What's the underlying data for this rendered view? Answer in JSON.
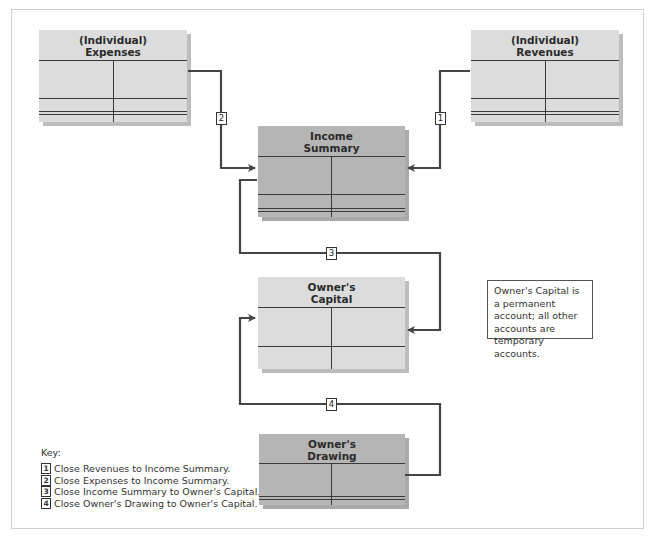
{
  "diagram": {
    "accounts": {
      "expenses": {
        "title_line1": "(Individual)",
        "title_line2": "Expenses"
      },
      "revenues": {
        "title_line1": "(Individual)",
        "title_line2": "Revenues"
      },
      "income_summary": {
        "title_line1": "Income",
        "title_line2": "Summary"
      },
      "owners_capital": {
        "title_line1": "Owner's",
        "title_line2": "Capital"
      },
      "owners_drawing": {
        "title_line1": "Owner's",
        "title_line2": "Drawing"
      }
    },
    "connectors": [
      {
        "label": "1",
        "from": "Revenues",
        "to": "Income Summary"
      },
      {
        "label": "2",
        "from": "Expenses",
        "to": "Income Summary"
      },
      {
        "label": "3",
        "from": "Income Summary",
        "to": "Owner's Capital"
      },
      {
        "label": "4",
        "from": "Owner's Drawing",
        "to": "Owner's Capital"
      }
    ],
    "note": "Owner's Capital is a permanent account; all other accounts are temporary accounts.",
    "key": {
      "title": "Key:",
      "items": [
        {
          "num": "1",
          "text": "Close Revenues to Income Summary."
        },
        {
          "num": "2",
          "text": "Close Expenses to Income Summary."
        },
        {
          "num": "3",
          "text": "Close Income Summary to Owner's Capital."
        },
        {
          "num": "4",
          "text": "Close Owner's Drawing to Owner's Capital."
        }
      ]
    },
    "colors": {
      "light_account": "#dcdcdc",
      "dark_account": "#b5b5b5",
      "connector": "#454545"
    }
  }
}
